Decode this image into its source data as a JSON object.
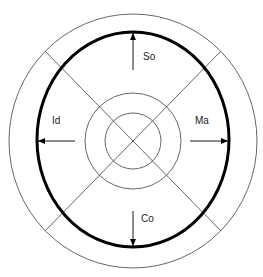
{
  "diagram": {
    "title": "",
    "colors": {
      "background": "#ffffff",
      "thin_line": "#555555",
      "thick_line": "#000000",
      "text": "#222222"
    },
    "center": {
      "x": 133,
      "y": 141
    },
    "rings": [
      {
        "name": "outer-circle",
        "rx": 124,
        "ry": 127
      },
      {
        "name": "boundary-ellipse",
        "rx": 96,
        "ry": 107,
        "bold": true
      },
      {
        "name": "middle-circle",
        "r": 48
      },
      {
        "name": "inner-circle",
        "r": 28
      }
    ],
    "labels": {
      "top": "So",
      "left": "Id",
      "right": "Ma",
      "bottom": "Co"
    },
    "arrows": [
      {
        "direction": "up",
        "label": "So"
      },
      {
        "direction": "left",
        "label": "Id"
      },
      {
        "direction": "right",
        "label": "Ma"
      },
      {
        "direction": "down",
        "label": "Co"
      }
    ]
  }
}
